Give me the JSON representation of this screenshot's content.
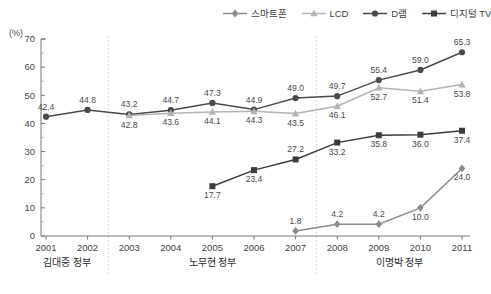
{
  "axis": {
    "unit_label": "(%)",
    "y_ticks": [
      "70",
      "60",
      "50",
      "40",
      "30",
      "20",
      "10",
      "0"
    ],
    "y_min": 0,
    "y_max": 70,
    "y_step": 10
  },
  "legend": {
    "position": "top-right",
    "items": [
      {
        "label": "스마트폰",
        "marker": "diamond-icon",
        "color": "#8c8c8c"
      },
      {
        "label": "LCD",
        "marker": "triangle-icon",
        "color": "#b4b4b4"
      },
      {
        "label": "D램",
        "marker": "circle-icon",
        "color": "#4a4a4a"
      },
      {
        "label": "디지털 TV",
        "marker": "square-icon",
        "color": "#3c3c3c"
      }
    ]
  },
  "groups": [
    {
      "label": "김대중 정부",
      "years": [
        "2001",
        "2002"
      ]
    },
    {
      "label": "노무현 정부",
      "years": [
        "2003",
        "2004",
        "2005",
        "2006",
        "2007"
      ]
    },
    {
      "label": "이명박 정부",
      "years": [
        "2008",
        "2009",
        "2010",
        "2011"
      ]
    }
  ],
  "chart_data": {
    "type": "line",
    "title": "",
    "xlabel": "",
    "ylabel": "(%)",
    "ylim": [
      0,
      70
    ],
    "grid": false,
    "categories": [
      "2001",
      "2002",
      "2003",
      "2004",
      "2005",
      "2006",
      "2007",
      "2008",
      "2009",
      "2010",
      "2011"
    ],
    "series": [
      {
        "name": "D램",
        "marker": "circle",
        "color": "#4a4a4a",
        "values": [
          42.4,
          44.8,
          43.2,
          44.7,
          47.3,
          44.9,
          49.0,
          49.7,
          55.4,
          59.0,
          65.3
        ],
        "labels": [
          "42.4",
          "44.8",
          "43.2",
          "44.7",
          "47.3",
          "44.9",
          "49.0",
          "49.7",
          "55.4",
          "59.0",
          "65.3"
        ],
        "label_pos": [
          "above",
          "above",
          "above",
          "above",
          "above",
          "above",
          "above",
          "above",
          "above",
          "above",
          "above"
        ]
      },
      {
        "name": "LCD",
        "marker": "triangle",
        "color": "#b4b4b4",
        "values": [
          null,
          null,
          42.8,
          43.6,
          44.1,
          44.3,
          43.5,
          46.1,
          52.7,
          51.4,
          53.8
        ],
        "labels": [
          null,
          null,
          "42.8",
          "43.6",
          "44.1",
          "44.3",
          "43.5",
          "46.1",
          "52.7",
          "51.4",
          "53.8"
        ],
        "label_pos": [
          null,
          null,
          "below",
          "below",
          "below",
          "below",
          "below",
          "below",
          "below",
          "below",
          "below"
        ]
      },
      {
        "name": "디지털 TV",
        "marker": "square",
        "color": "#3c3c3c",
        "values": [
          null,
          null,
          null,
          null,
          17.7,
          23.4,
          27.2,
          33.2,
          35.8,
          36.0,
          37.4
        ],
        "labels": [
          null,
          null,
          null,
          null,
          "17.7",
          "23.4",
          "27.2",
          "33.2",
          "35.8",
          "36.0",
          "37.4"
        ],
        "label_pos": [
          null,
          null,
          null,
          null,
          "below",
          "below",
          "above",
          "below",
          "below",
          "below",
          "below"
        ]
      },
      {
        "name": "스마트폰",
        "marker": "diamond",
        "color": "#8c8c8c",
        "values": [
          null,
          null,
          null,
          null,
          null,
          null,
          1.8,
          4.2,
          4.2,
          10.0,
          24.0
        ],
        "labels": [
          null,
          null,
          null,
          null,
          null,
          null,
          "1.8",
          "4.2",
          "4.2",
          "10.0",
          "24.0"
        ],
        "label_pos": [
          null,
          null,
          null,
          null,
          null,
          null,
          "above",
          "above",
          "above",
          "below",
          "below"
        ]
      }
    ]
  }
}
